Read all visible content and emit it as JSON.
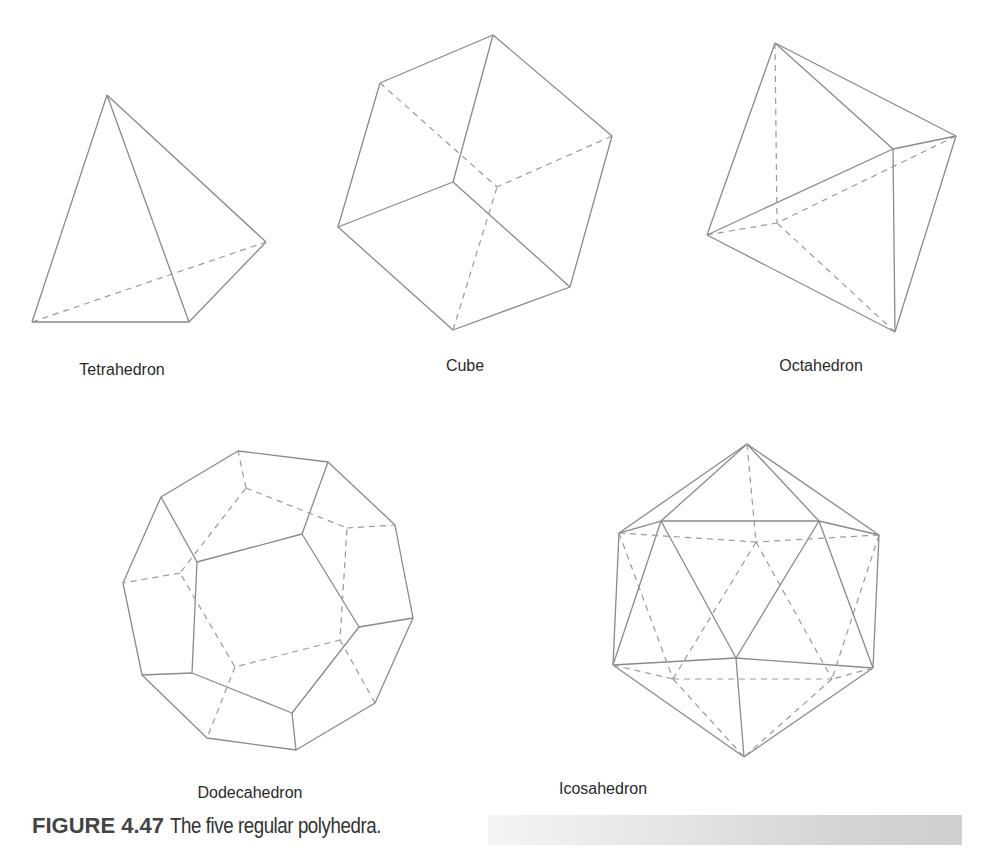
{
  "figure": {
    "number": "FIGURE 4.47",
    "caption": "The five regular polyhedra.",
    "caption_bar_color": "#d4d4d4"
  },
  "polyhedra": [
    {
      "name": "Tetrahedron",
      "faces": 4
    },
    {
      "name": "Cube",
      "faces": 6
    },
    {
      "name": "Octahedron",
      "faces": 8
    },
    {
      "name": "Dodecahedron",
      "faces": 12
    },
    {
      "name": "Icosahedron",
      "faces": 20
    }
  ],
  "style": {
    "edge_color": "#8a8a8a",
    "hidden_edge_style": "dashed"
  }
}
